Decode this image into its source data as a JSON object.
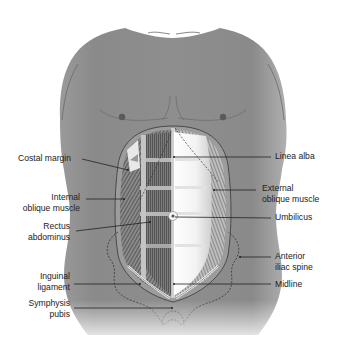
{
  "figure": {
    "type": "anatomical-diagram",
    "colors": {
      "skin": "#8f8f8f",
      "skin_light": "#b5b5b5",
      "muscle_dark": "#555555",
      "muscle_mid": "#7a7a7a",
      "linea_alba": "#ffffff",
      "leader_line": "#222222",
      "text": "#222222"
    }
  },
  "labels_left": [
    {
      "id": "costal-margin",
      "lines": [
        "Costal margin"
      ]
    },
    {
      "id": "internal-oblique-muscle",
      "lines": [
        "Internal",
        "oblique muscle"
      ]
    },
    {
      "id": "rectus-abdominus",
      "lines": [
        "Rectus",
        "abdominus"
      ]
    },
    {
      "id": "inguinal-ligament",
      "lines": [
        "Inguinal",
        "ligament"
      ]
    },
    {
      "id": "symphysis-pubis",
      "lines": [
        "Symphysis",
        "pubis"
      ]
    }
  ],
  "labels_right": [
    {
      "id": "linea-alba",
      "lines": [
        "Linea alba"
      ]
    },
    {
      "id": "external-oblique-muscle",
      "lines": [
        "External",
        "oblique muscle"
      ]
    },
    {
      "id": "umbilicus",
      "lines": [
        "Umbilicus"
      ]
    },
    {
      "id": "anterior-iliac-spine",
      "lines": [
        "Anterior",
        "iliac spine"
      ]
    },
    {
      "id": "midline",
      "lines": [
        "Midline"
      ]
    }
  ]
}
